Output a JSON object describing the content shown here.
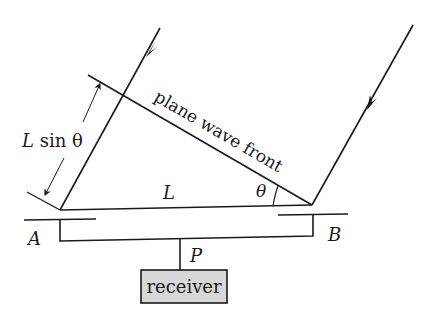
{
  "diagram": {
    "labels": {
      "wavefront": "plane wave front",
      "path_difference": "L sin θ",
      "baseline": "L",
      "angle": "θ",
      "element_a": "A",
      "element_b": "B",
      "junction": "P",
      "receiver": "receiver"
    },
    "colors": {
      "stroke": "#1a1a1a",
      "receiver_fill": "#d8d8d8",
      "background": "#ffffff"
    }
  }
}
